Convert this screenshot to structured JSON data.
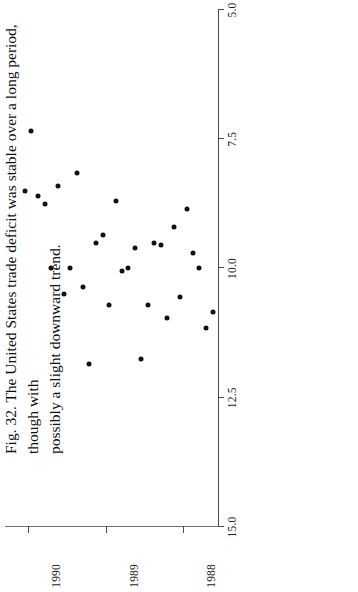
{
  "figure": {
    "caption": "Fig. 32. The United States trade deficit was stable over a long period, though with possibly a slight downward trend.",
    "caption_line1": "Fig. 32. The United States trade deficit was stable over a long period, though with",
    "caption_line2": "possibly a slight downward trend.",
    "orientation": "rotated-90",
    "ink_color": "#111111",
    "axis_color": "#4a4a4a",
    "reference_line_color": "#6f6f6f"
  },
  "chart_data": {
    "type": "scatter",
    "title": "",
    "xlabel": "",
    "ylabel": "",
    "grid": false,
    "legend": null,
    "xlim": [
      1987.55,
      1990.3
    ],
    "ylim": [
      5.0,
      15.0
    ],
    "yticks": [
      15.0,
      12.5,
      10.0,
      7.5,
      5.0
    ],
    "ytick_labels": [
      "15.0",
      "12.5",
      "10.0",
      "7.5",
      "5.0"
    ],
    "xticks": [
      1988,
      1989,
      1990
    ],
    "xtick_labels": [
      "1988",
      "1989",
      "1990"
    ],
    "reference_line_y": 10.0,
    "x": [
      1987.62,
      1987.7,
      1987.79,
      1987.87,
      1987.95,
      1988.04,
      1988.12,
      1988.21,
      1988.29,
      1988.37,
      1988.46,
      1988.54,
      1988.62,
      1988.71,
      1988.79,
      1988.87,
      1988.96,
      1989.04,
      1989.12,
      1989.21,
      1989.29,
      1989.37,
      1989.46,
      1989.54,
      1989.62,
      1989.7,
      1989.79,
      1989.87,
      1989.96,
      1990.04
    ],
    "y": [
      10.85,
      11.15,
      10.0,
      9.7,
      8.85,
      10.55,
      9.2,
      10.95,
      9.55,
      9.5,
      10.7,
      11.75,
      9.6,
      10.0,
      10.05,
      8.7,
      10.7,
      9.35,
      9.5,
      11.85,
      10.35,
      8.15,
      10.0,
      10.5,
      8.4,
      10.0,
      8.75,
      8.6,
      7.35,
      8.5
    ],
    "series_name": "US trade deficit",
    "n_points": 30
  }
}
